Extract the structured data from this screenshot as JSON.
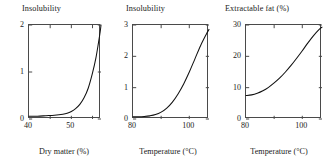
{
  "figure": {
    "width": 329,
    "height": 161,
    "background": "#ffffff",
    "axis_color": "#4a4a4a",
    "curve_color": "#111111"
  },
  "chart_data": [
    {
      "type": "line",
      "panel_index": 1,
      "title": "Insolubility",
      "xlabel": "Dry matter (%)",
      "ylabel": "",
      "xlim": [
        40,
        57
      ],
      "ylim": [
        0,
        2
      ],
      "xticks": [
        40,
        45,
        50,
        55
      ],
      "xtick_labels": [
        "40",
        "",
        "50",
        ""
      ],
      "yticks": [
        0,
        1,
        2
      ],
      "ytick_labels": [
        "0",
        "1",
        "2"
      ],
      "grid": false,
      "legend": "none",
      "frame": "box",
      "tick_direction": "in",
      "series": [
        {
          "name": "insolubility vs dry matter",
          "x": [
            40,
            42,
            44,
            46,
            48,
            49,
            50,
            51,
            52,
            53,
            54,
            55,
            55.8,
            56.4,
            56.8,
            57
          ],
          "y": [
            0.06,
            0.06,
            0.07,
            0.08,
            0.1,
            0.12,
            0.16,
            0.22,
            0.31,
            0.45,
            0.66,
            0.98,
            1.3,
            1.62,
            1.85,
            2.0
          ]
        }
      ]
    },
    {
      "type": "line",
      "panel_index": 2,
      "title": "Insolubility",
      "xlabel": "Temperature (°C)",
      "ylabel": "",
      "xlim": [
        80,
        107
      ],
      "ylim": [
        0,
        3
      ],
      "xticks": [
        80,
        90,
        100
      ],
      "xtick_labels": [
        "80",
        "",
        "100"
      ],
      "yticks": [
        0,
        1,
        2,
        3
      ],
      "ytick_labels": [
        "0",
        "1",
        "2",
        "3"
      ],
      "grid": false,
      "legend": "none",
      "frame": "box",
      "tick_direction": "in",
      "series": [
        {
          "name": "insolubility vs temperature",
          "x": [
            80,
            82,
            84,
            86,
            88,
            90,
            92,
            94,
            96,
            98,
            100,
            102,
            104,
            106,
            107
          ],
          "y": [
            0.07,
            0.07,
            0.08,
            0.1,
            0.14,
            0.22,
            0.35,
            0.54,
            0.8,
            1.12,
            1.5,
            1.92,
            2.34,
            2.7,
            2.86
          ]
        }
      ]
    },
    {
      "type": "line",
      "panel_index": 3,
      "title": "Extractable fat (%)",
      "xlabel": "Temperature (°C)",
      "ylabel": "",
      "xlim": [
        80,
        107
      ],
      "ylim": [
        0,
        30
      ],
      "xticks": [
        80,
        90,
        100
      ],
      "xtick_labels": [
        "80",
        "",
        "100"
      ],
      "yticks": [
        0,
        10,
        20,
        30
      ],
      "ytick_labels": [
        "0",
        "10",
        "20",
        "30"
      ],
      "grid": false,
      "legend": "none",
      "frame": "box",
      "tick_direction": "in",
      "series": [
        {
          "name": "extractable fat vs temperature",
          "x": [
            80,
            82,
            84,
            86,
            88,
            90,
            92,
            94,
            96,
            98,
            100,
            102,
            104,
            106,
            107
          ],
          "y": [
            7.5,
            7.7,
            8.2,
            9.0,
            10.1,
            11.5,
            13.1,
            15.0,
            17.1,
            19.4,
            21.8,
            24.3,
            26.6,
            28.6,
            29.3
          ]
        }
      ]
    }
  ],
  "panels": [
    {
      "title": "Insolubility",
      "xlabel": "Dry matter (%)",
      "ytick_labels": [
        "2",
        "1",
        "0"
      ],
      "xtick_labels": [
        "40",
        "50"
      ]
    },
    {
      "title": "Insolubility",
      "xlabel": "Temperature (°C)",
      "ytick_labels": [
        "3",
        "2",
        "1",
        "0"
      ],
      "xtick_labels": [
        "80",
        "100"
      ]
    },
    {
      "title": "Extractable fat (%)",
      "xlabel": "Temperature (°C)",
      "ytick_labels": [
        "30",
        "20",
        "10",
        "0"
      ],
      "xtick_labels": [
        "80",
        "100"
      ]
    }
  ]
}
